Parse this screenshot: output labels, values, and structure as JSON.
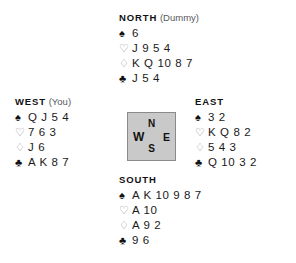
{
  "diagram": {
    "suit_glyphs": {
      "spades": "♠",
      "hearts": "♡",
      "diamonds": "♢",
      "clubs": "♣"
    }
  },
  "compass": {
    "north": "N",
    "east": "E",
    "south": "S",
    "west": "W"
  },
  "hands": {
    "north": {
      "seat": "NORTH",
      "role": "(Dummy)",
      "spades": "6",
      "hearts": "J 9 5 4",
      "diamonds": "K Q 10 8 7",
      "clubs": "J 5 4"
    },
    "west": {
      "seat": "WEST",
      "role": "(You)",
      "spades": "Q J 5 4",
      "hearts": "7 6 3",
      "diamonds": "J 6",
      "clubs": "A K 8 7"
    },
    "east": {
      "seat": "EAST",
      "role": "",
      "spades": "3 2",
      "hearts": "K Q 8 2",
      "diamonds": "5 4 3",
      "clubs": "Q 10 3 2"
    },
    "south": {
      "seat": "SOUTH",
      "role": "",
      "spades": "A K 10 9 8 7",
      "hearts": "A 10",
      "diamonds": "A 9 2",
      "clubs": "9 6"
    }
  },
  "colors": {
    "background": "#ffffff",
    "text": "#1a1a1a",
    "muted_text": "#58595b",
    "hollow_suit": "#8d8f91",
    "compass_fill": "#c9c9c9",
    "compass_border": "#8a8a8a"
  }
}
